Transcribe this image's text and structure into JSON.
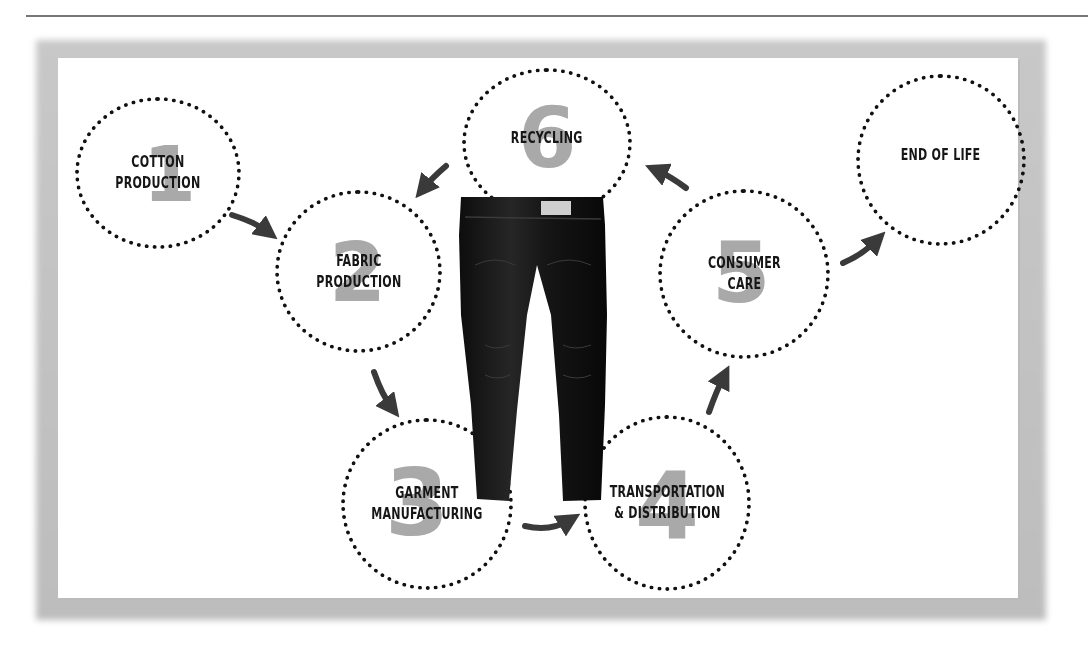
{
  "header": {
    "page_number": "",
    "rule_color": "#777777"
  },
  "diagram": {
    "stages": [
      {
        "id": 1,
        "number": "1",
        "label_lines": [
          "COTTON",
          "PRODUCTION"
        ]
      },
      {
        "id": 2,
        "number": "2",
        "label_lines": [
          "FABRIC",
          "PRODUCTION"
        ]
      },
      {
        "id": 3,
        "number": "3",
        "label_lines": [
          "GARMENT",
          "MANUFACTURING"
        ]
      },
      {
        "id": 4,
        "number": "4",
        "label_lines": [
          "TRANSPORTATION",
          "& DISTRIBUTION"
        ]
      },
      {
        "id": 5,
        "number": "5",
        "label_lines": [
          "CONSUMER",
          "CARE"
        ]
      },
      {
        "id": 6,
        "number": "6",
        "label_lines": [
          "RECYCLING"
        ]
      },
      {
        "id": 7,
        "number": "",
        "label_lines": [
          "END OF LIFE"
        ]
      }
    ],
    "arrows": [
      {
        "from": "COTTON PRODUCTION",
        "to": "FABRIC PRODUCTION"
      },
      {
        "from": "FABRIC PRODUCTION",
        "to": "GARMENT MANUFACTURING"
      },
      {
        "from": "GARMENT MANUFACTURING",
        "to": "TRANSPORTATION & DISTRIBUTION"
      },
      {
        "from": "TRANSPORTATION & DISTRIBUTION",
        "to": "CONSUMER CARE"
      },
      {
        "from": "CONSUMER CARE",
        "to": "RECYCLING"
      },
      {
        "from": "RECYCLING",
        "to": "FABRIC PRODUCTION"
      },
      {
        "from": "CONSUMER CARE",
        "to": "END OF LIFE"
      }
    ],
    "center_image": "jeans",
    "colors": {
      "number_fill": "#a9a9a9",
      "arrow": "#3a3a3a",
      "dotted_border": "#111111",
      "label": "#161616",
      "frame_shadow": "#c4c4c4"
    }
  }
}
